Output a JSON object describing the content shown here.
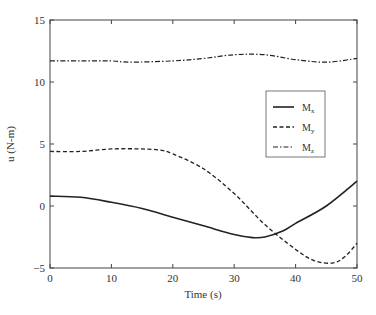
{
  "chart_data": {
    "type": "line",
    "title": "",
    "xlabel": "Time (s)",
    "ylabel": "u (N-m)",
    "xlim": [
      0,
      50
    ],
    "ylim": [
      -5,
      15
    ],
    "xticks": [
      0,
      10,
      20,
      30,
      40,
      50
    ],
    "yticks": [
      -5,
      0,
      5,
      10,
      15
    ],
    "xtick_labels": [
      "0",
      "10",
      "20",
      "30",
      "40",
      "50"
    ],
    "ytick_labels": [
      "−5",
      "0",
      "5",
      "10",
      "15"
    ],
    "grid": false,
    "legend_position": "right-center inside",
    "series": [
      {
        "name": "Mx",
        "label_main": "M",
        "label_sub": "x",
        "style": "solid",
        "x": [
          0,
          5,
          10,
          15,
          20,
          25,
          30,
          33,
          35,
          38,
          40,
          45,
          50
        ],
        "values": [
          0.8,
          0.7,
          0.3,
          -0.2,
          -0.9,
          -1.6,
          -2.3,
          -2.55,
          -2.5,
          -2.0,
          -1.4,
          0.0,
          2.0
        ]
      },
      {
        "name": "My",
        "label_main": "M",
        "label_sub": "y",
        "style": "dashed",
        "x": [
          0,
          5,
          10,
          15,
          18,
          20,
          25,
          30,
          35,
          40,
          43,
          46,
          48,
          50
        ],
        "values": [
          4.4,
          4.4,
          4.6,
          4.6,
          4.5,
          4.2,
          3.0,
          1.0,
          -1.5,
          -3.5,
          -4.4,
          -4.6,
          -4.1,
          -3.0
        ]
      },
      {
        "name": "Mz",
        "label_main": "M",
        "label_sub": "z",
        "style": "dashdot",
        "x": [
          0,
          5,
          10,
          13,
          20,
          25,
          30,
          35,
          40,
          45,
          50
        ],
        "values": [
          11.7,
          11.7,
          11.7,
          11.6,
          11.7,
          11.9,
          12.2,
          12.2,
          11.8,
          11.6,
          11.9
        ]
      }
    ]
  }
}
